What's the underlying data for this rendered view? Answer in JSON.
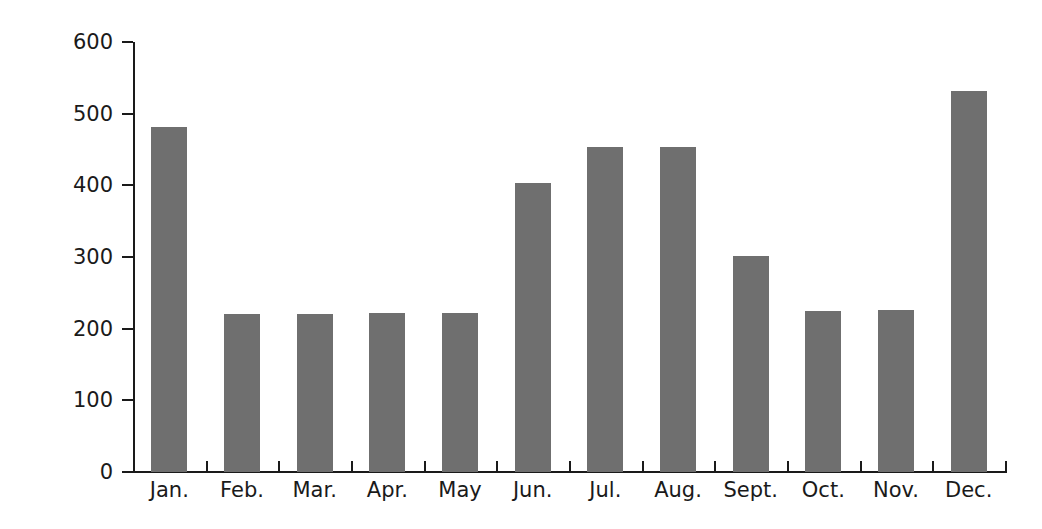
{
  "chart_data": {
    "type": "bar",
    "title": "",
    "subtitle": "",
    "xlabel": "",
    "ylabel": "Euro",
    "categories": [
      "Jan.",
      "Feb.",
      "Mar.",
      "Apr.",
      "May",
      "Jun.",
      "Jul.",
      "Aug.",
      "Sept.",
      "Oct.",
      "Nov.",
      "Dec."
    ],
    "values": [
      482,
      221,
      221,
      222,
      222,
      403,
      453,
      454,
      302,
      225,
      226,
      531
    ],
    "series": [
      {
        "name": "Euro",
        "values": [
          482,
          221,
          221,
          222,
          222,
          403,
          453,
          454,
          302,
          225,
          226,
          531
        ]
      }
    ],
    "ylim": [
      0,
      600
    ],
    "yticks": [
      0,
      100,
      200,
      300,
      400,
      500,
      600
    ],
    "ytick_labels": [
      "0",
      "100",
      "200",
      "300",
      "400",
      "500",
      "600"
    ],
    "grid": false,
    "legend": false,
    "legend_position": "none",
    "bar_color": "#6f6f6f",
    "axis_color": "#1a1a1a",
    "background_color": "#ffffff",
    "annotations": []
  }
}
